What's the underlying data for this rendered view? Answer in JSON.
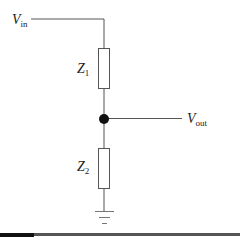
{
  "diagram": {
    "labels": {
      "vin": {
        "main": "V",
        "sub": "in"
      },
      "vout": {
        "main": "V",
        "sub": "out"
      },
      "z1": {
        "main": "Z",
        "sub": "1"
      },
      "z2": {
        "main": "Z",
        "sub": "2"
      }
    },
    "colors": {
      "wire": "#555555",
      "node": "#111111",
      "bottom_rule": "#444444",
      "bottom_rule_left": "#111111"
    },
    "components": [
      {
        "id": "Z1",
        "type": "impedance",
        "orientation": "vertical"
      },
      {
        "id": "Z2",
        "type": "impedance",
        "orientation": "vertical"
      },
      {
        "id": "node",
        "type": "junction"
      },
      {
        "id": "ground",
        "type": "ground"
      }
    ]
  }
}
